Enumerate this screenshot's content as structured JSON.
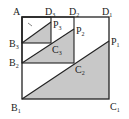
{
  "diagram": {
    "type": "nested-squares-geometry",
    "colors": {
      "stroke": "#222222",
      "shade": "#c8c8c8",
      "background": "#ffffff"
    },
    "points": {
      "A": {
        "label": "A",
        "sub": "",
        "x": 22,
        "y": 17
      },
      "D3": {
        "label": "D",
        "sub": "3",
        "x": 51,
        "y": 17
      },
      "D2": {
        "label": "D",
        "sub": "2",
        "x": 74,
        "y": 17
      },
      "D1": {
        "label": "D",
        "sub": "1",
        "x": 109,
        "y": 17
      },
      "B3": {
        "label": "B",
        "sub": "3",
        "x": 22,
        "y": 43
      },
      "B2": {
        "label": "B",
        "sub": "2",
        "x": 22,
        "y": 63
      },
      "B1": {
        "label": "B",
        "sub": "1",
        "x": 22,
        "y": 99
      },
      "C3": {
        "label": "C",
        "sub": "3",
        "x": 51,
        "y": 43
      },
      "C2": {
        "label": "C",
        "sub": "2",
        "x": 74,
        "y": 63
      },
      "C1": {
        "label": "C",
        "sub": "1",
        "x": 109,
        "y": 99
      },
      "P3": {
        "label": "P",
        "sub": "3",
        "x": 51,
        "y": 22
      },
      "P2": {
        "label": "P",
        "sub": "2",
        "x": 74,
        "y": 29
      },
      "P1": {
        "label": "P",
        "sub": "1",
        "x": 109,
        "y": 41
      }
    },
    "labels": {
      "A": "A",
      "D3": "D",
      "D3s": "3",
      "D2": "D",
      "D2s": "2",
      "D1": "D",
      "D1s": "1",
      "B3": "B",
      "B3s": "3",
      "B2": "B",
      "B2s": "2",
      "B1": "B",
      "B1s": "1",
      "C3": "C",
      "C3s": "3",
      "C2": "C",
      "C2s": "2",
      "C1": "C",
      "C1s": "1",
      "P3": "P",
      "P3s": "3",
      "P2": "P",
      "P2s": "2",
      "P1": "P",
      "P1s": "1"
    },
    "squares": [
      "A-B1-C1-D1",
      "A-B2-C2-D2",
      "A-B3-C3-D3"
    ],
    "shaded_triangles": [
      "B1-C1-P1",
      "B2-C2-P2",
      "B3-C3-P3"
    ]
  }
}
